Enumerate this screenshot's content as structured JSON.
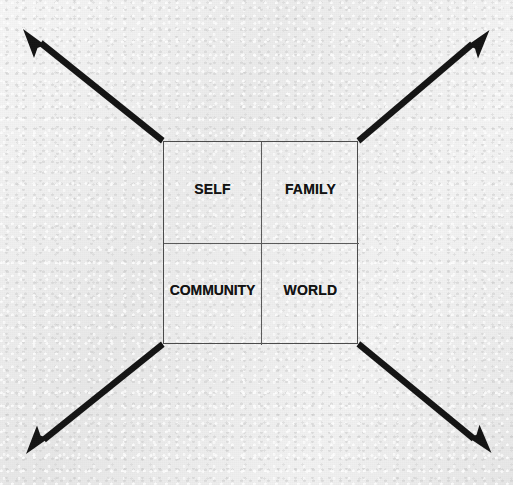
{
  "diagram": {
    "background_color": "#e9e9e9",
    "line_color": "#4a4a4a",
    "arrow_color": "#141414",
    "matrix": {
      "rows": 2,
      "columns": 2,
      "cells": [
        {
          "id": "self",
          "label": "SELF",
          "position": "top-left"
        },
        {
          "id": "family",
          "label": "FAMILY",
          "position": "top-right"
        },
        {
          "id": "community",
          "label": "COMMUNITY",
          "position": "bottom-left"
        },
        {
          "id": "world",
          "label": "WORLD",
          "position": "bottom-right"
        }
      ]
    },
    "arrows": [
      {
        "id": "arrow-top-left",
        "direction": "up-left",
        "from": [
          163,
          141
        ],
        "to": [
          24,
          30
        ]
      },
      {
        "id": "arrow-top-right",
        "direction": "up-right",
        "from": [
          358,
          141
        ],
        "to": [
          488,
          31
        ]
      },
      {
        "id": "arrow-bottom-left",
        "direction": "down-left",
        "from": [
          163,
          344
        ],
        "to": [
          27,
          453
        ]
      },
      {
        "id": "arrow-bottom-right",
        "direction": "down-right",
        "from": [
          358,
          344
        ],
        "to": [
          490,
          452
        ]
      }
    ]
  }
}
